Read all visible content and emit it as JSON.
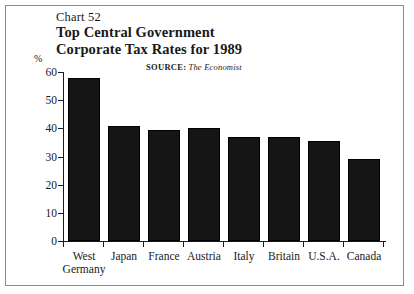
{
  "figure": {
    "chart_number": "Chart 52",
    "title_line1": "Top Central Government",
    "title_line2": "Corporate Tax Rates for 1989",
    "source_label": "SOURCE:",
    "source_name": "The Economist",
    "percent_symbol": "%"
  },
  "chart_data": {
    "type": "bar",
    "title": "Top Central Government Corporate Tax Rates for 1989",
    "subtitle": "Chart 52",
    "source": "SOURCE: The Economist",
    "xlabel": "",
    "ylabel": "%",
    "ylim": [
      0,
      60
    ],
    "yticks": [
      0,
      10,
      20,
      30,
      40,
      50,
      60
    ],
    "ytick_labels": [
      "0",
      "10",
      "20",
      "30",
      "40",
      "50",
      "60"
    ],
    "grid": false,
    "legend": false,
    "bar_color": "#151515",
    "categories": [
      "West Germany",
      "Japan",
      "France",
      "Austria",
      "Italy",
      "Britain",
      "U.S.A.",
      "Canada"
    ],
    "category_labels": [
      {
        "line1": "West",
        "line2": "Germany"
      },
      {
        "line1": "Japan",
        "line2": ""
      },
      {
        "line1": "France",
        "line2": ""
      },
      {
        "line1": "Austria",
        "line2": ""
      },
      {
        "line1": "Italy",
        "line2": ""
      },
      {
        "line1": "Britain",
        "line2": ""
      },
      {
        "line1": "U.S.A.",
        "line2": ""
      },
      {
        "line1": "Canada",
        "line2": ""
      }
    ],
    "values": [
      58,
      41,
      39.5,
      40,
      37,
      37,
      35.5,
      29
    ]
  }
}
